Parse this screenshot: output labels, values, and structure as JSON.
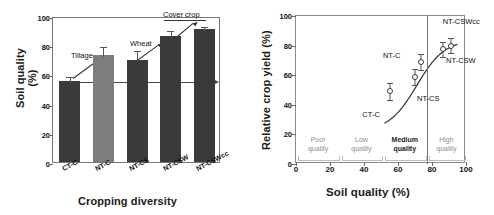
{
  "chart_data": [
    {
      "type": "bar",
      "panel": "left",
      "title": "",
      "xlabel": "Cropping diversity",
      "ylabel": "Soil quality (%)",
      "ylabel_line1": "Soil quality",
      "ylabel_line2": "(%)",
      "ylim": [
        0,
        100
      ],
      "yticks": [
        0,
        20,
        40,
        60,
        80,
        100
      ],
      "grid": false,
      "categories": [
        "CT-C",
        "NT-C",
        "NT-CS",
        "NT-CSW",
        "NT-CSWcc"
      ],
      "values": [
        55.5,
        73.5,
        70.0,
        86.5,
        91.0
      ],
      "errors": [
        4.0,
        6.5,
        7.5,
        4.5,
        3.0
      ],
      "bar_colors": [
        "#3a3a3a",
        "#7d7d7d",
        "#3a3a3a",
        "#3a3a3a",
        "#3a3a3a"
      ],
      "annotations": [
        {
          "text": "Tillage",
          "points_to": "NT-C"
        },
        {
          "text": "Wheat",
          "points_to": "NT-CSW"
        },
        {
          "text": "Cover crop",
          "points_to": "NT-CSWcc"
        },
        {
          "text": "2004",
          "position": "start-of-trend-arrow"
        },
        {
          "text": "2014",
          "position": "end-of-trend-arrow"
        }
      ]
    },
    {
      "type": "scatter",
      "panel": "right",
      "title": "",
      "xlabel": "Soil quality (%)",
      "ylabel": "Relative crop yield (%)",
      "xlim": [
        0,
        100
      ],
      "ylim": [
        0,
        100
      ],
      "xticks": [
        0,
        20,
        40,
        60,
        80,
        100
      ],
      "yticks": [
        0,
        20,
        40,
        60,
        80,
        100
      ],
      "grid": false,
      "legend": "none",
      "points": [
        {
          "label": "CT-C",
          "x": 55.5,
          "y": 49.0,
          "yerr": 6.0
        },
        {
          "label": "NT-CS",
          "x": 70.0,
          "y": 59.0,
          "yerr": 5.5
        },
        {
          "label": "NT-C",
          "x": 73.5,
          "y": 69.0,
          "yerr": 5.5
        },
        {
          "label": "NT-CSW",
          "x": 86.5,
          "y": 77.5,
          "yerr": 5.0
        },
        {
          "label": "NT-CSWcc",
          "x": 91.0,
          "y": 80.0,
          "yerr": 5.0
        }
      ],
      "fit_curve": "sigmoid through points",
      "zones": [
        {
          "label_line1": "Poor",
          "label_line2": "quality",
          "x_start": 0,
          "x_end": 26,
          "emphasis": "normal"
        },
        {
          "label_line1": "Low",
          "label_line2": "quality",
          "x_start": 26,
          "x_end": 51,
          "emphasis": "normal"
        },
        {
          "label_line1": "Medium",
          "label_line2": "quality",
          "x_start": 51,
          "x_end": 77,
          "emphasis": "strong"
        },
        {
          "label_line1": "High",
          "label_line2": "quality",
          "x_start": 77,
          "x_end": 100,
          "emphasis": "normal"
        }
      ],
      "zone_divider_x": 77
    }
  ]
}
